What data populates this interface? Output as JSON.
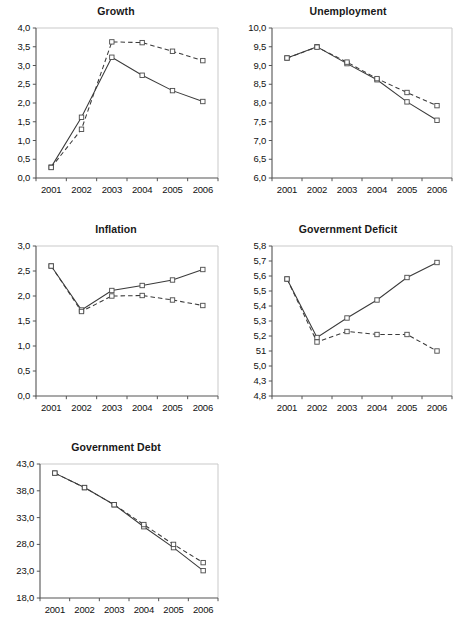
{
  "figure": {
    "background_color": "#ffffff",
    "line_color": "#3a3a3a",
    "axis_color": "#555555",
    "frame_color": "#c9c9c9"
  },
  "charts": [
    {
      "id": "growth",
      "title": "Growth",
      "type": "line",
      "x": [
        "2001",
        "2002",
        "2003",
        "2004",
        "2005",
        "2006"
      ],
      "xlabel": "",
      "ylabel": "",
      "ylim": [
        0.0,
        4.0
      ],
      "yticks": [
        0.0,
        0.5,
        1.0,
        1.5,
        2.0,
        2.5,
        3.0,
        3.5,
        4.0
      ],
      "yticklabels": [
        "0,0",
        "0,5",
        "1,0",
        "1,5",
        "2,0",
        "2,5",
        "3,0",
        "3,5",
        "4,0"
      ],
      "grid": false,
      "series": [
        {
          "name": "solid",
          "style": "solid",
          "values": [
            0.29,
            1.62,
            3.22,
            2.74,
            2.33,
            2.04
          ]
        },
        {
          "name": "dashed",
          "style": "dashed",
          "values": [
            0.28,
            1.3,
            3.63,
            3.61,
            3.38,
            3.13
          ]
        }
      ]
    },
    {
      "id": "unemployment",
      "title": "Unemployment",
      "type": "line",
      "x": [
        "2001",
        "2002",
        "2003",
        "2004",
        "2005",
        "2006"
      ],
      "xlabel": "",
      "ylabel": "",
      "ylim": [
        6.0,
        10.0
      ],
      "yticks": [
        6.0,
        6.5,
        7.0,
        7.5,
        8.0,
        8.5,
        9.0,
        9.5,
        10.0
      ],
      "yticklabels": [
        "6,0",
        "6,5",
        "7,0",
        "7,5",
        "8,0",
        "8,5",
        "9,0",
        "9,5",
        "10,0"
      ],
      "grid": false,
      "series": [
        {
          "name": "solid",
          "style": "solid",
          "values": [
            9.2,
            9.5,
            9.05,
            8.62,
            8.03,
            7.54
          ]
        },
        {
          "name": "dashed",
          "style": "dashed",
          "values": [
            9.2,
            9.49,
            9.09,
            8.65,
            8.28,
            7.93
          ]
        }
      ]
    },
    {
      "id": "inflation",
      "title": "Inflation",
      "type": "line",
      "x": [
        "2001",
        "2002",
        "2003",
        "2004",
        "2005",
        "2006"
      ],
      "xlabel": "",
      "ylabel": "",
      "ylim": [
        0.0,
        3.0
      ],
      "yticks": [
        0.0,
        0.5,
        1.0,
        1.5,
        2.0,
        2.5,
        3.0
      ],
      "yticklabels": [
        "0,0",
        "0,5",
        "1,0",
        "1,5",
        "2,0",
        "2,5",
        "3,0"
      ],
      "grid": false,
      "series": [
        {
          "name": "solid",
          "style": "solid",
          "values": [
            2.6,
            1.72,
            2.11,
            2.21,
            2.32,
            2.53
          ]
        },
        {
          "name": "dashed",
          "style": "dashed",
          "values": [
            2.6,
            1.69,
            2.0,
            2.01,
            1.92,
            1.81
          ]
        }
      ]
    },
    {
      "id": "government-deficit",
      "title": "Government Deficit",
      "type": "line",
      "x": [
        "2001",
        "2002",
        "2003",
        "2004",
        "2005",
        "2006"
      ],
      "xlabel": "",
      "ylabel": "",
      "ylim": [
        4.8,
        5.8
      ],
      "yticks": [
        4.8,
        4.9,
        5.0,
        5.1,
        5.2,
        5.3,
        5.4,
        5.5,
        5.6,
        5.7,
        5.8
      ],
      "yticklabels": [
        "4,8",
        "4,3",
        "5,0",
        "51",
        "5,2",
        "5,3",
        "5,4",
        "5,5",
        "5,6",
        "5,7",
        "5,8"
      ],
      "grid": false,
      "series": [
        {
          "name": "solid",
          "style": "solid",
          "values": [
            5.58,
            5.19,
            5.32,
            5.44,
            5.59,
            5.69
          ]
        },
        {
          "name": "dashed",
          "style": "dashed",
          "values": [
            5.58,
            5.16,
            5.23,
            5.21,
            5.21,
            5.1
          ]
        }
      ]
    },
    {
      "id": "government-debt",
      "title": "Government Debt",
      "type": "line",
      "x": [
        "2001",
        "2002",
        "2003",
        "2004",
        "2005",
        "2006"
      ],
      "xlabel": "",
      "ylabel": "",
      "ylim": [
        18.0,
        43.0
      ],
      "yticks": [
        18.0,
        23.0,
        28.0,
        33.0,
        38.0,
        43.0
      ],
      "yticklabels": [
        "18,0",
        "23,0",
        "28,0",
        "33,0",
        "38,0",
        "43,0"
      ],
      "grid": false,
      "series": [
        {
          "name": "solid",
          "style": "solid",
          "values": [
            41.3,
            38.6,
            35.4,
            31.3,
            27.4,
            23.1
          ]
        },
        {
          "name": "dashed",
          "style": "dashed",
          "values": [
            41.3,
            38.6,
            35.4,
            31.7,
            28.0,
            24.6
          ]
        }
      ]
    }
  ]
}
